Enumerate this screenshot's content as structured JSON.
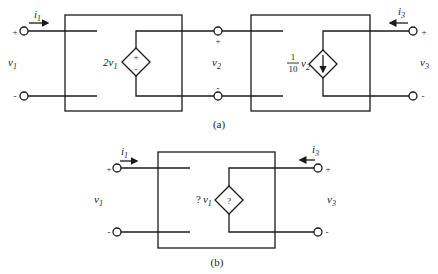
{
  "figure": {
    "colors": {
      "ink": "#1a1a1a",
      "background": "#ffffff"
    },
    "a": {
      "caption": "(a)",
      "input_port": {
        "voltage": "v",
        "voltage_sub": "1",
        "current": "i",
        "current_sub": "1",
        "plus": "+",
        "minus": "-"
      },
      "middle_port": {
        "voltage": "v",
        "voltage_sub": "2",
        "plus": "+",
        "minus": "-"
      },
      "output_port": {
        "voltage": "v",
        "voltage_sub": "3",
        "current": "i",
        "current_sub": "3",
        "plus": "+",
        "minus": "-"
      },
      "block1": {
        "source_type": "dependent-voltage-source",
        "gain_label": "2v",
        "gain_sub": "1",
        "polarity_plus": "+",
        "polarity_minus": "-"
      },
      "block2": {
        "source_type": "dependent-current-source",
        "gain_num": "1",
        "gain_den": "10",
        "gain_var": "v",
        "gain_sub": "2",
        "arrow": "down"
      }
    },
    "b": {
      "caption": "(b)",
      "input_port": {
        "voltage": "v",
        "voltage_sub": "1",
        "current": "i",
        "current_sub": "1",
        "plus": "+",
        "minus": "-"
      },
      "output_port": {
        "voltage": "v",
        "voltage_sub": "3",
        "current": "i",
        "current_sub": "3",
        "plus": "+",
        "minus": "-"
      },
      "block": {
        "source_type": "unknown-dependent-source",
        "gain_prefix": "?",
        "gain_var": "v",
        "gain_sub": "1",
        "symbol": "?"
      }
    }
  }
}
